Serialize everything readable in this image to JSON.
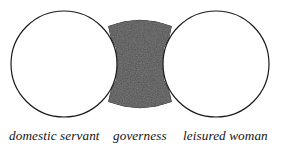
{
  "figure": {
    "type": "venn-diagram",
    "background_color": "#ffffff",
    "outline_color": "#1a1a1a",
    "fill_color_shaded": "#2b2b2b",
    "fill_color_plain": "#ffffff",
    "circle_radius": 53,
    "regions": [
      {
        "id": "domestic-servant",
        "label": "domestic servant",
        "shading": "none",
        "shape": "circle",
        "center_x": 64,
        "center_y": 64
      },
      {
        "id": "governess",
        "label": "governess",
        "shading": "stippled-dark",
        "shape": "concave-gap",
        "center_x": 140,
        "center_y": 64
      },
      {
        "id": "leisured-woman",
        "label": "leisured woman",
        "shading": "none",
        "shape": "circle",
        "center_x": 216,
        "center_y": 64
      }
    ]
  }
}
